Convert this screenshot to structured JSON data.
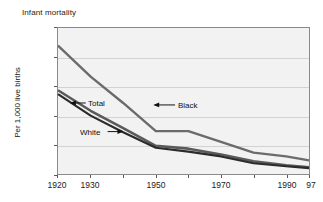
{
  "chart_data": {
    "type": "line",
    "title": "Infant mortality",
    "xlabel": "",
    "ylabel": "Per 1,000 live births",
    "xlim": [
      1920,
      1997
    ],
    "ylim": [
      0,
      150
    ],
    "grid": true,
    "legend_position": "inline-annotations",
    "x_tick_labels": [
      "1920",
      "1930",
      "1950",
      "1970",
      "1990",
      "97"
    ],
    "x_tick_values": [
      1920,
      1930,
      1950,
      1970,
      1990,
      1997
    ],
    "x_minor_ticks": [
      1920,
      1930,
      1940,
      1950,
      1960,
      1970,
      1980,
      1990,
      1997
    ],
    "y_tick_labels": [
      "0",
      "30",
      "60",
      "90",
      "120",
      "150"
    ],
    "y_tick_values": [
      0,
      30,
      60,
      90,
      120,
      150
    ],
    "x": [
      1920,
      1930,
      1940,
      1950,
      1960,
      1970,
      1980,
      1990,
      1997
    ],
    "series": [
      {
        "name": "Black",
        "label": "Black",
        "color": "#6b6b6b",
        "values": [
          132,
          100,
          73,
          44,
          44,
          33,
          22,
          18,
          14
        ]
      },
      {
        "name": "Total",
        "label": "Total",
        "color": "#5a5a5a",
        "values": [
          86,
          65,
          47,
          29,
          26,
          20,
          13,
          9,
          7
        ]
      },
      {
        "name": "White",
        "label": "White",
        "color": "#2b2b2b",
        "values": [
          82,
          60,
          43,
          27,
          23,
          18,
          11,
          8,
          6
        ]
      }
    ],
    "annotations": [
      {
        "name": "total-annotation",
        "text": "Total",
        "arrow": "left"
      },
      {
        "name": "black-annotation",
        "text": "Black",
        "arrow": "left"
      },
      {
        "name": "white-annotation",
        "text": "White",
        "arrow": "right"
      }
    ],
    "colors": {
      "plot_background": "#f2f2f2",
      "gridline": "#d2d2d2",
      "axis": "#8a8a8a",
      "text": "#1a1a1a"
    }
  }
}
